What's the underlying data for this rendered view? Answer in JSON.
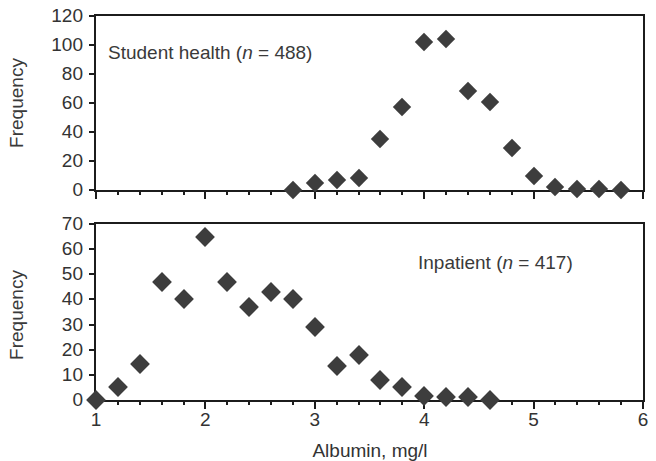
{
  "chart_data": [
    {
      "type": "scatter",
      "id": "student-health",
      "title": "Student health (n = 488)",
      "annotation_prefix": "Student health (",
      "annotation_italic": "n",
      "annotation_suffix": " = 488)",
      "xlabel": "Albumin, mg/l",
      "ylabel": "Frequency",
      "xlim": [
        1,
        6
      ],
      "ylim": [
        0,
        120
      ],
      "yticks": [
        0,
        20,
        40,
        60,
        80,
        100,
        120
      ],
      "ytick_labels": [
        "0",
        "20",
        "40",
        "60",
        "80",
        "100",
        "120"
      ],
      "xticks_major": [
        1,
        2,
        3,
        4,
        5,
        6
      ],
      "xtick_labels": [
        "",
        "",
        "",
        "",
        "",
        ""
      ],
      "xtick_minor_step": 0.2,
      "grid": false,
      "legend": "none",
      "marker": "diamond",
      "marker_color": "#3d3d3d",
      "points": [
        {
          "x": 2.8,
          "y": 0
        },
        {
          "x": 3.0,
          "y": 5
        },
        {
          "x": 3.2,
          "y": 7
        },
        {
          "x": 3.4,
          "y": 8
        },
        {
          "x": 3.6,
          "y": 35
        },
        {
          "x": 3.8,
          "y": 57
        },
        {
          "x": 4.0,
          "y": 102
        },
        {
          "x": 4.2,
          "y": 104
        },
        {
          "x": 4.4,
          "y": 68
        },
        {
          "x": 4.6,
          "y": 61
        },
        {
          "x": 4.8,
          "y": 29
        },
        {
          "x": 5.0,
          "y": 10
        },
        {
          "x": 5.2,
          "y": 2
        },
        {
          "x": 5.4,
          "y": 1
        },
        {
          "x": 5.6,
          "y": 1
        },
        {
          "x": 5.8,
          "y": 0
        }
      ]
    },
    {
      "type": "scatter",
      "id": "inpatient",
      "title": "Inpatient (n = 417)",
      "annotation_prefix": "Inpatient (",
      "annotation_italic": "n",
      "annotation_suffix": " = 417)",
      "xlabel": "Albumin, mg/l",
      "ylabel": "Frequency",
      "xlim": [
        1,
        6
      ],
      "ylim": [
        0,
        70
      ],
      "yticks": [
        0,
        10,
        20,
        30,
        40,
        50,
        60,
        70
      ],
      "ytick_labels": [
        "0",
        "10",
        "20",
        "30",
        "40",
        "50",
        "60",
        "70"
      ],
      "xticks_major": [
        1,
        2,
        3,
        4,
        5,
        6
      ],
      "xtick_labels": [
        "1",
        "2",
        "3",
        "4",
        "5",
        "6"
      ],
      "xtick_minor_step": 0.2,
      "grid": false,
      "legend": "none",
      "marker": "diamond",
      "marker_color": "#3d3d3d",
      "points": [
        {
          "x": 1.0,
          "y": 0
        },
        {
          "x": 1.2,
          "y": 5
        },
        {
          "x": 1.4,
          "y": 14.5
        },
        {
          "x": 1.6,
          "y": 47
        },
        {
          "x": 1.8,
          "y": 40
        },
        {
          "x": 2.0,
          "y": 65
        },
        {
          "x": 2.2,
          "y": 47
        },
        {
          "x": 2.4,
          "y": 37
        },
        {
          "x": 2.6,
          "y": 43
        },
        {
          "x": 2.8,
          "y": 40
        },
        {
          "x": 3.0,
          "y": 29
        },
        {
          "x": 3.2,
          "y": 13.5
        },
        {
          "x": 3.4,
          "y": 18
        },
        {
          "x": 3.6,
          "y": 8
        },
        {
          "x": 3.8,
          "y": 5
        },
        {
          "x": 4.0,
          "y": 1.5
        },
        {
          "x": 4.2,
          "y": 1
        },
        {
          "x": 4.4,
          "y": 1
        },
        {
          "x": 4.6,
          "y": 0
        }
      ]
    }
  ],
  "axis": {
    "x_title": "Albumin, mg/l",
    "y_title_top": "Frequency",
    "y_title_bottom": "Frequency"
  }
}
